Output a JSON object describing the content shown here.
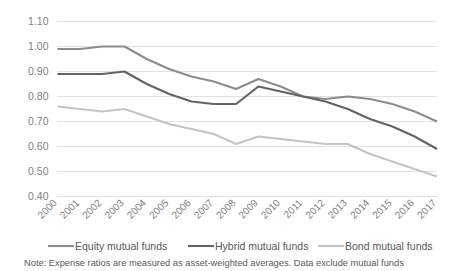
{
  "chart_data": {
    "type": "line",
    "title": "",
    "xlabel": "",
    "ylabel": "",
    "ylim": [
      0.4,
      1.1
    ],
    "ytick_labels": [
      "1.10",
      "1.00",
      "0.90",
      "0.80",
      "0.70",
      "0.60",
      "0.50",
      "0.40"
    ],
    "ytick_values": [
      1.1,
      1.0,
      0.9,
      0.8,
      0.7,
      0.6,
      0.5,
      0.4
    ],
    "grid": true,
    "legend_position": "bottom",
    "categories": [
      "2000",
      "2001",
      "2002",
      "2003",
      "2004",
      "2005",
      "2006",
      "2007",
      "2008",
      "2009",
      "2010",
      "2011",
      "2012",
      "2013",
      "2014",
      "2015",
      "2016",
      "2017"
    ],
    "series": [
      {
        "name": "Equity mutual funds",
        "color": "#8c8c8c",
        "values": [
          0.99,
          0.99,
          1.0,
          1.0,
          0.95,
          0.91,
          0.88,
          0.86,
          0.83,
          0.87,
          0.84,
          0.8,
          0.79,
          0.8,
          0.79,
          0.77,
          0.74,
          0.7
        ]
      },
      {
        "name": "Hybrid mutual funds",
        "color": "#636363",
        "values": [
          0.89,
          0.89,
          0.89,
          0.9,
          0.85,
          0.81,
          0.78,
          0.77,
          0.77,
          0.84,
          0.82,
          0.8,
          0.78,
          0.75,
          0.71,
          0.68,
          0.64,
          0.59
        ]
      },
      {
        "name": "Bond mutual funds",
        "color": "#c4c4c4",
        "values": [
          0.76,
          0.75,
          0.74,
          0.75,
          0.72,
          0.69,
          0.67,
          0.65,
          0.61,
          0.64,
          0.63,
          0.62,
          0.61,
          0.61,
          0.57,
          0.54,
          0.51,
          0.48
        ]
      }
    ],
    "note": "Note: Expense ratios are measured as asset-weighted averages. Data exclude mutual funds"
  },
  "legend": {
    "items": [
      {
        "label": "Equity mutual funds"
      },
      {
        "label": "Hybrid mutual funds"
      },
      {
        "label": "Bond mutual funds"
      }
    ]
  },
  "footer": {
    "note": "Note: Expense ratios are measured as asset-weighted averages. Data exclude mutual funds"
  }
}
